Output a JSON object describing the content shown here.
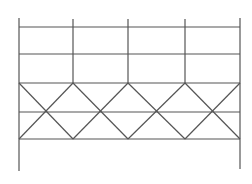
{
  "diagram": {
    "type": "structural-frame",
    "stroke_color": "#555555",
    "stroke_width": 1.2,
    "columns_x": [
      19,
      73,
      128,
      185,
      240
    ],
    "outer_columns": {
      "top_y": 18,
      "bottom_y": 171,
      "bottom_y_right": 169
    },
    "inner_columns": {
      "top_y": 19,
      "bottom_y": 83
    },
    "horizontal_rows_y": [
      27,
      54,
      83,
      112,
      139
    ],
    "bracing": {
      "top_y": 83,
      "bottom_y": 139,
      "crossing_y": 112,
      "bays": 4
    }
  }
}
